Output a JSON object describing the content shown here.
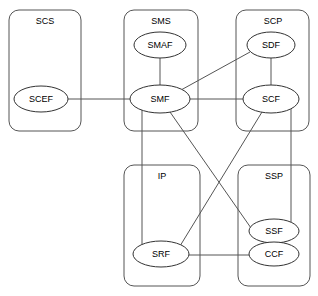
{
  "diagram": {
    "type": "node-link-diagram",
    "background_color": "#ffffff",
    "line_color": "#555555",
    "node_stroke_color": "#333333",
    "node_fill_color": "#ffffff",
    "canvas": {
      "width": 318,
      "height": 296
    }
  },
  "domains": [
    {
      "id": "scs",
      "label": "SCS",
      "x": 9,
      "y": 10,
      "width": 72,
      "height": 121,
      "rx": 10,
      "label_x": 45,
      "label_y": 22
    },
    {
      "id": "sms",
      "label": "SMS",
      "x": 124,
      "y": 10,
      "width": 74,
      "height": 121,
      "rx": 10,
      "label_x": 161,
      "label_y": 22
    },
    {
      "id": "scp",
      "label": "SCP",
      "x": 236,
      "y": 10,
      "width": 73,
      "height": 121,
      "rx": 10,
      "label_x": 273,
      "label_y": 22
    },
    {
      "id": "ip",
      "label": "IP",
      "x": 124,
      "y": 165,
      "width": 76,
      "height": 121,
      "rx": 10,
      "label_x": 162,
      "label_y": 177
    },
    {
      "id": "ssp",
      "label": "SSP",
      "x": 238,
      "y": 165,
      "width": 72,
      "height": 121,
      "rx": 10,
      "label_x": 274,
      "label_y": 177
    }
  ],
  "nodes": [
    {
      "id": "scef",
      "label": "SCEF",
      "cx": 41,
      "cy": 99,
      "rx": 27,
      "ry": 13
    },
    {
      "id": "smaf",
      "label": "SMAF",
      "cx": 160,
      "cy": 45,
      "rx": 26,
      "ry": 13
    },
    {
      "id": "smf",
      "label": "SMF",
      "cx": 160,
      "cy": 99,
      "rx": 30,
      "ry": 14
    },
    {
      "id": "sdf",
      "label": "SDF",
      "cx": 271,
      "cy": 45,
      "rx": 24,
      "ry": 13
    },
    {
      "id": "scf",
      "label": "SCF",
      "cx": 271,
      "cy": 99,
      "rx": 28,
      "ry": 14
    },
    {
      "id": "srf",
      "label": "SRF",
      "cx": 161,
      "cy": 254,
      "rx": 28,
      "ry": 13
    },
    {
      "id": "ssf",
      "label": "SSF",
      "cx": 274,
      "cy": 231,
      "rx": 25,
      "ry": 12
    },
    {
      "id": "ccf",
      "label": "CCF",
      "cx": 274,
      "cy": 254,
      "rx": 25,
      "ry": 12
    }
  ],
  "links": [
    {
      "id": "scef-smf",
      "from": "SCEF",
      "to": "SMF",
      "x1": 68,
      "y1": 99,
      "x2": 130,
      "y2": 99
    },
    {
      "id": "smaf-smf",
      "from": "SMAF",
      "to": "SMF",
      "x1": 160,
      "y1": 58,
      "x2": 160,
      "y2": 85
    },
    {
      "id": "smf-sdf",
      "from": "SMF",
      "to": "SDF",
      "x1": 181,
      "y1": 90,
      "x2": 250,
      "y2": 52
    },
    {
      "id": "smf-scf",
      "from": "SMF",
      "to": "SCF",
      "x1": 190,
      "y1": 99,
      "x2": 243,
      "y2": 99
    },
    {
      "id": "sdf-scf",
      "from": "SDF",
      "to": "SCF",
      "x1": 271,
      "y1": 58,
      "x2": 271,
      "y2": 85
    },
    {
      "id": "smf-srf",
      "from": "SMF",
      "to": "SRF",
      "x1": 142,
      "y1": 109,
      "x2": 142,
      "y2": 248
    },
    {
      "id": "smf-ssf",
      "from": "SMF",
      "to": "SSF",
      "x1": 170,
      "y1": 112,
      "x2": 251,
      "y2": 228
    },
    {
      "id": "scf-srf",
      "from": "SCF",
      "to": "SRF",
      "x1": 262,
      "y1": 112,
      "x2": 180,
      "y2": 246
    },
    {
      "id": "scf-ssf",
      "from": "SCF",
      "to": "SSF",
      "x1": 291,
      "y1": 96,
      "x2": 291,
      "y2": 228
    },
    {
      "id": "srf-ccf",
      "from": "SRF",
      "to": "CCF",
      "x1": 189,
      "y1": 255,
      "x2": 249,
      "y2": 255
    }
  ]
}
